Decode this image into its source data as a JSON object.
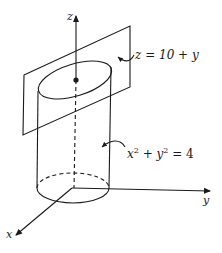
{
  "diagram": {
    "axes": {
      "x_label": "x",
      "y_label": "y",
      "z_label": "z"
    },
    "annotations": {
      "plane_equation": "z = 10 + y",
      "cylinder_equation_base": "x",
      "cylinder_exp1": "2",
      "cylinder_mid": " + y",
      "cylinder_exp2": "2",
      "cylinder_rhs": " = 4"
    },
    "colors": {
      "stroke": "#1a1a1a",
      "background": "#ffffff"
    }
  }
}
